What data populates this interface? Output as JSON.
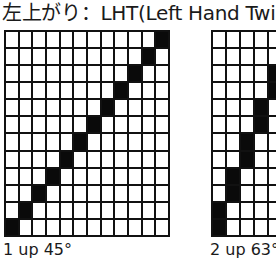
{
  "title": "左上がり：LHT(Left Hand Twill)",
  "diagrams": [
    {
      "label": "1 up 45°",
      "rows": 12,
      "cols": 12,
      "filled": [
        [
          11,
          0
        ],
        [
          10,
          1
        ],
        [
          9,
          2
        ],
        [
          8,
          3
        ],
        [
          7,
          4
        ],
        [
          6,
          5
        ],
        [
          5,
          6
        ],
        [
          4,
          7
        ],
        [
          3,
          8
        ],
        [
          2,
          9
        ],
        [
          1,
          10
        ],
        [
          0,
          11
        ]
      ]
    },
    {
      "label": "2 up 63°",
      "rows": 12,
      "cols": 5,
      "filled": [
        [
          10,
          0
        ],
        [
          11,
          0
        ],
        [
          8,
          1
        ],
        [
          9,
          1
        ],
        [
          6,
          2
        ],
        [
          7,
          2
        ],
        [
          4,
          3
        ],
        [
          5,
          3
        ],
        [
          2,
          4
        ],
        [
          3,
          4
        ],
        [
          0,
          5
        ],
        [
          1,
          5
        ]
      ]
    }
  ],
  "colors": {
    "fill": "#0a0a0a",
    "grid_line": "#111111",
    "background": "#ffffff"
  }
}
